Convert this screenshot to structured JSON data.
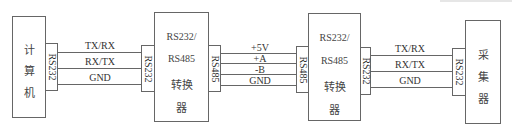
{
  "diagram": {
    "computer": {
      "chars": [
        "计",
        "算",
        "机"
      ],
      "port": "RS232"
    },
    "link1": {
      "signals": [
        "TX/RX",
        "RX/TX",
        "GND"
      ]
    },
    "converter1": {
      "lines": [
        "RS232/",
        "RS485",
        "转换",
        "器"
      ],
      "port_left": "RS232",
      "port_right": "RS485"
    },
    "link2": {
      "signals": [
        "+5V",
        "+A",
        "-B",
        "GND"
      ]
    },
    "converter2": {
      "lines": [
        "RS232/",
        "RS485",
        "转换",
        "器"
      ],
      "port_left": "RS485",
      "port_right": "RS232"
    },
    "link3": {
      "signals": [
        "TX/RX",
        "RX/TX",
        "GND"
      ]
    },
    "collector": {
      "chars": [
        "采",
        "集",
        "器"
      ],
      "port": "RS232"
    }
  }
}
